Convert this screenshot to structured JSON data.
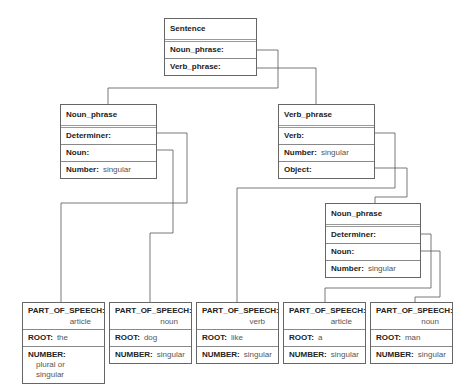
{
  "sentence": {
    "title": "Sentence",
    "slots": [
      {
        "label": "Noun_phrase:"
      },
      {
        "label": "Verb_phrase:"
      }
    ]
  },
  "noun_phrase_1": {
    "title": "Noun_phrase",
    "determiner_label": "Determiner:",
    "noun_label": "Noun:",
    "number_label": "Number:",
    "number_value": "singular"
  },
  "verb_phrase": {
    "title": "Verb_phrase",
    "verb_label": "Verb:",
    "number_label": "Number:",
    "number_value": "singular",
    "object_label": "Object:"
  },
  "noun_phrase_2": {
    "title": "Noun_phrase",
    "determiner_label": "Determiner:",
    "noun_label": "Noun:",
    "number_label": "Number:",
    "number_value": "singular"
  },
  "leaf_labels": {
    "pos": "PART_OF_SPEECH:",
    "root": "ROOT:",
    "number": "NUMBER:"
  },
  "leaves": [
    {
      "pos": "article",
      "root": "the",
      "number_line1": "plural or",
      "number_line2": "singular"
    },
    {
      "pos": "noun",
      "root": "dog",
      "number_line1": "singular",
      "number_line2": ""
    },
    {
      "pos": "verb",
      "root": "like",
      "number_line1": "singular",
      "number_line2": ""
    },
    {
      "pos": "article",
      "root": "a",
      "number_line1": "singular",
      "number_line2": ""
    },
    {
      "pos": "noun",
      "root": "man",
      "number_line1": "singular",
      "number_line2": ""
    }
  ]
}
